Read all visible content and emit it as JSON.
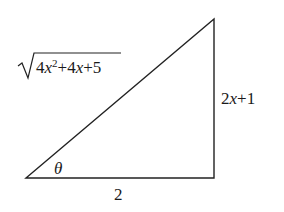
{
  "figure": {
    "type": "right-triangle",
    "vertices": {
      "bottom_left": [
        26,
        178
      ],
      "bottom_right": [
        214,
        178
      ],
      "top": [
        214,
        19
      ]
    },
    "labels": {
      "hypotenuse": "√(4x²+4x+5)",
      "hypotenuse_radicand_parts": [
        "4",
        "x",
        "2",
        "+4",
        "x",
        "+5"
      ],
      "vertical_side": "2x+1",
      "vertical_parts": [
        "2",
        "x",
        "+1"
      ],
      "base": "2",
      "angle": "θ"
    },
    "colors": {
      "stroke": "#222222",
      "text": "#1a1a1a",
      "background": "#ffffff"
    }
  }
}
